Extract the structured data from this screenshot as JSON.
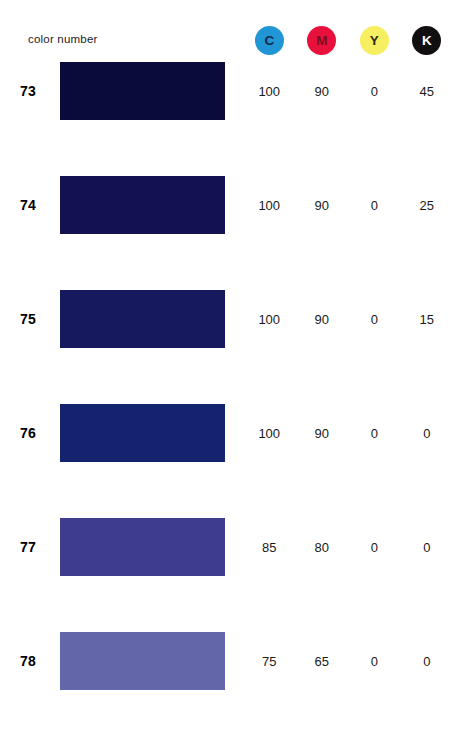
{
  "header": {
    "label": "color number",
    "inks": [
      {
        "letter": "C",
        "name": "cyan",
        "bg": "#2196d4",
        "fg": "#10284a"
      },
      {
        "letter": "M",
        "name": "magenta",
        "bg": "#e8113c",
        "fg": "#7c0c20"
      },
      {
        "letter": "Y",
        "name": "yellow",
        "bg": "#f7ef62",
        "fg": "#2b2a16"
      },
      {
        "letter": "K",
        "name": "black",
        "bg": "#110f10",
        "fg": "#ffffff"
      }
    ]
  },
  "chart_data": {
    "type": "table",
    "title": "color number",
    "columns": [
      "color number",
      "swatch",
      "C",
      "M",
      "Y",
      "K"
    ],
    "rows": [
      {
        "number": "73",
        "swatch": "#0b0b3b",
        "c": "100",
        "m": "90",
        "y": "0",
        "k": "45"
      },
      {
        "number": "74",
        "swatch": "#121252",
        "c": "100",
        "m": "90",
        "y": "0",
        "k": "25"
      },
      {
        "number": "75",
        "spacer": false,
        "swatch": "#17195e",
        "c": "100",
        "m": "90",
        "y": "0",
        "k": "15"
      },
      {
        "number": "76",
        "swatch": "#14236d",
        "c": "100",
        "m": "90",
        "y": "0",
        "k": "0"
      },
      {
        "number": "77",
        "swatch": "#3d3c8d",
        "c": "85",
        "m": "80",
        "y": "0",
        "k": "0"
      },
      {
        "number": "78",
        "swatch": "#6366a9",
        "c": "75",
        "m": "65",
        "y": "0",
        "k": "0"
      }
    ]
  }
}
